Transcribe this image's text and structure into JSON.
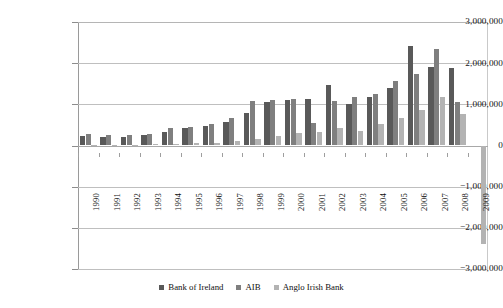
{
  "chart_data": {
    "type": "bar",
    "title": "",
    "subtitle": "",
    "xlabel": "",
    "ylabel": "",
    "ylim": [
      -3000000,
      3000000
    ],
    "grid": true,
    "legend_position": "bottom",
    "categories": [
      "1990",
      "1991",
      "1992",
      "1993",
      "1994",
      "1995",
      "1996",
      "1997",
      "1998",
      "1999",
      "2000",
      "2001",
      "2002",
      "2003",
      "2004",
      "2005",
      "2006",
      "2007",
      "2008",
      "2009"
    ],
    "ytick_labels": [
      "3,000,000",
      "2,000,000",
      "1,000,000",
      "0",
      "−1,000,000",
      "−2,000,000",
      "−3,000,000"
    ],
    "ytick_values": [
      3000000,
      2000000,
      1000000,
      0,
      -1000000,
      -2000000,
      -3000000
    ],
    "series": [
      {
        "name": "Bank of Ireland",
        "color": "#595959",
        "values": [
          230000,
          200000,
          215000,
          260000,
          340000,
          420000,
          470000,
          560000,
          780000,
          1060000,
          1110000,
          1120000,
          1480000,
          1000000,
          1190000,
          1400000,
          2420000,
          1900000,
          1880000,
          0
        ]
      },
      {
        "name": "AIB",
        "color": "#7f7f7f",
        "values": [
          290000,
          250000,
          255000,
          290000,
          420000,
          440000,
          520000,
          660000,
          1080000,
          1100000,
          1120000,
          540000,
          1090000,
          1180000,
          1240000,
          1570000,
          1730000,
          2340000,
          1060000,
          0
        ]
      },
      {
        "name": "Anglo Irish Bank",
        "color": "#b3b3b3",
        "values": [
          20000,
          15000,
          20000,
          25000,
          40000,
          50000,
          70000,
          110000,
          170000,
          230000,
          300000,
          330000,
          420000,
          350000,
          520000,
          680000,
          860000,
          1180000,
          770000,
          -2400000
        ]
      }
    ]
  },
  "legend": {
    "items": [
      {
        "label": "Bank of Ireland"
      },
      {
        "label": "AIB"
      },
      {
        "label": "Anglo Irish Bank"
      }
    ]
  }
}
